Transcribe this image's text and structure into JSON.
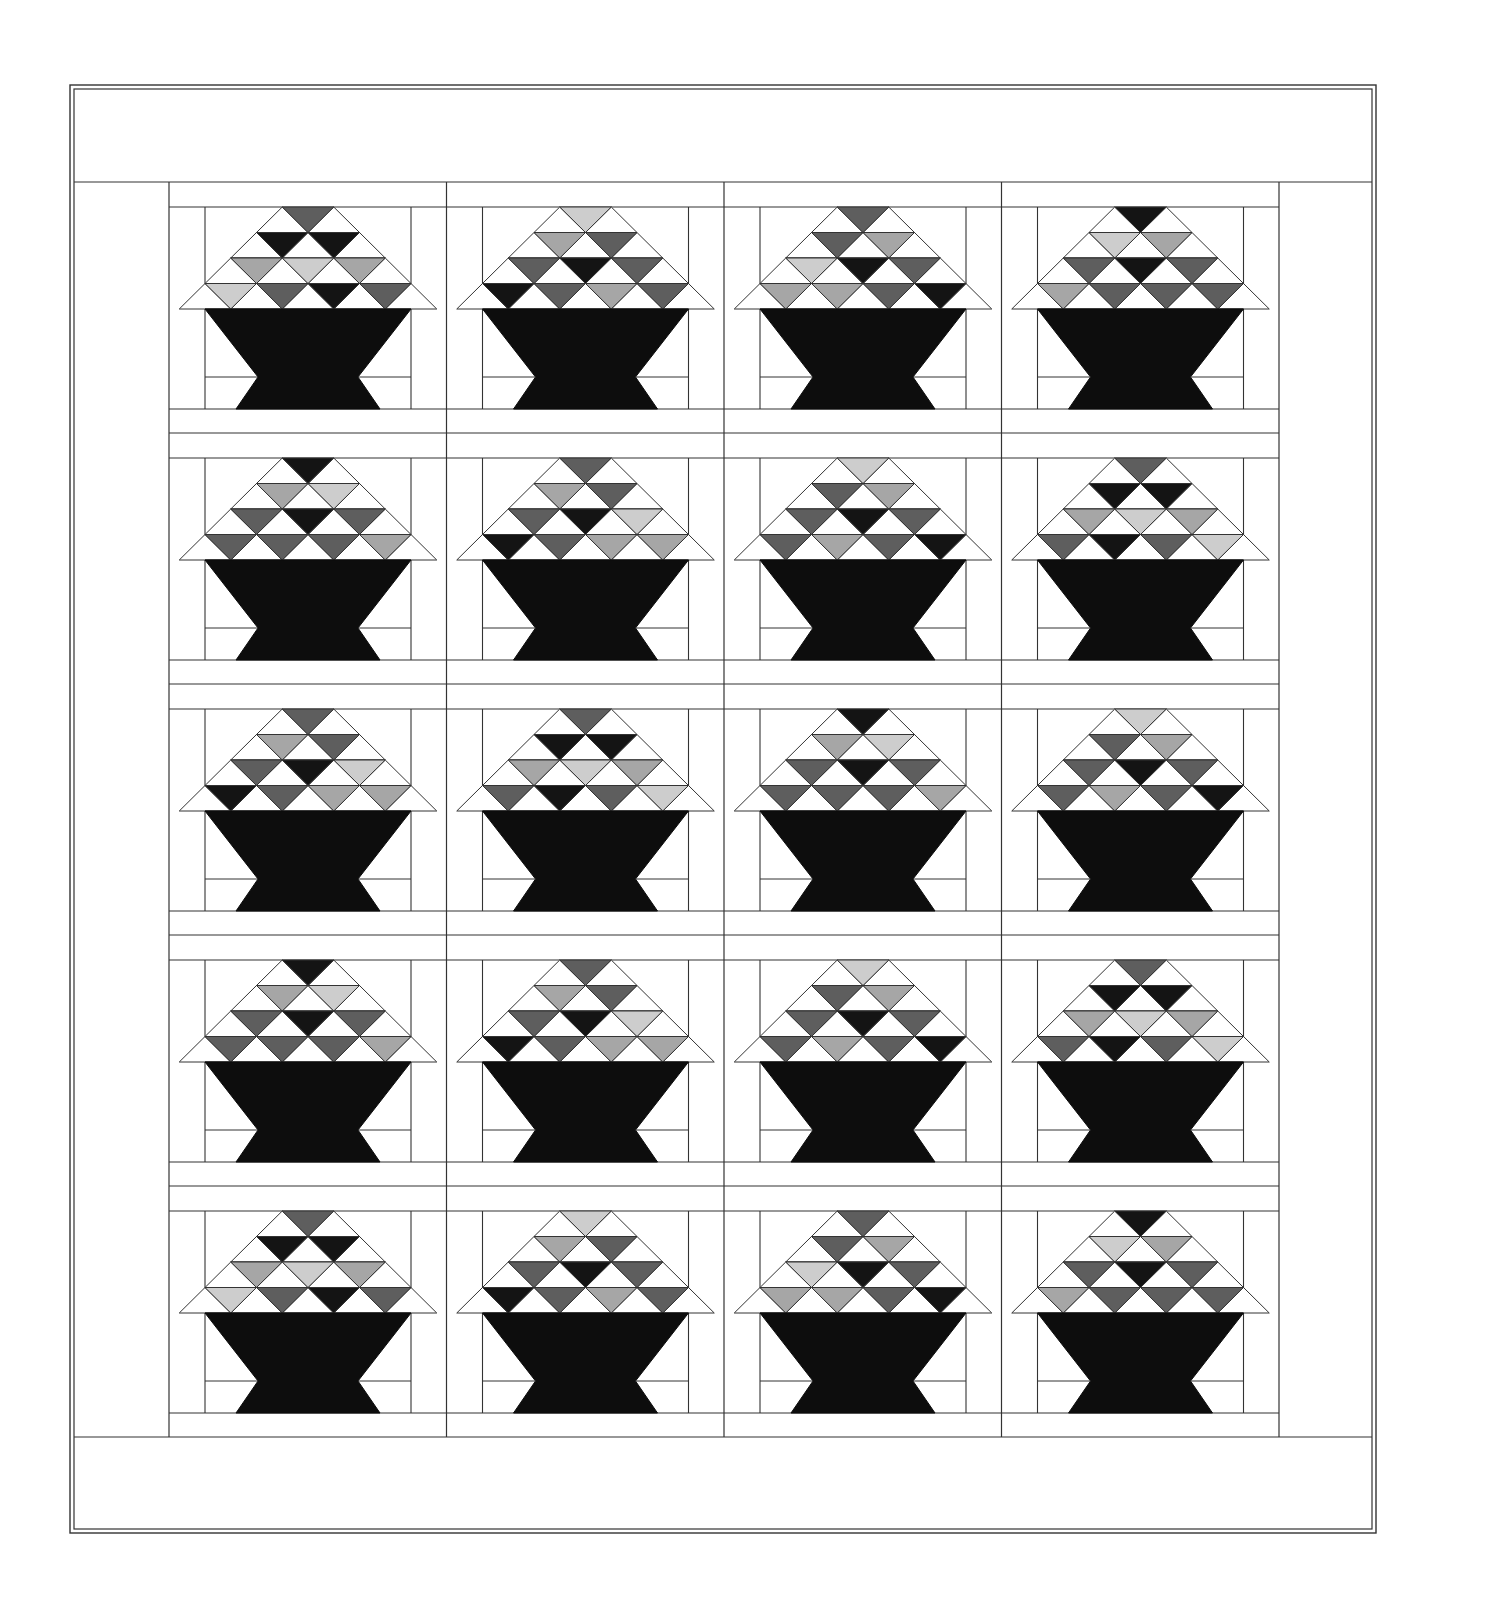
{
  "diagram": {
    "type": "quilt-layout",
    "grid": {
      "columns": 4,
      "rows": 5
    },
    "colors": {
      "background": "#ffffff",
      "line": "#333333",
      "basket": "#0d0d0d",
      "K": "#141414",
      "D": "#5e5e5e",
      "M": "#a6a6a6",
      "L": "#cdcdcd"
    },
    "color_legend": {
      "K": "black",
      "D": "dark gray",
      "M": "medium gray",
      "L": "light gray"
    },
    "outer_border": {
      "x": 70,
      "y": 85,
      "w": 1306,
      "h": 1448,
      "double_line": true
    },
    "center": {
      "x": 169,
      "y": 182,
      "col_width": 277.5,
      "row_height": 251
    },
    "blocks": [
      {
        "row": 1,
        "col": 1,
        "triangles": [
          [
            "D"
          ],
          [
            "K",
            "K"
          ],
          [
            "M",
            "L",
            "M"
          ],
          [
            "L",
            "D",
            "K",
            "D"
          ]
        ]
      },
      {
        "row": 1,
        "col": 2,
        "triangles": [
          [
            "L"
          ],
          [
            "M",
            "D"
          ],
          [
            "D",
            "K",
            "D"
          ],
          [
            "K",
            "D",
            "M",
            "D"
          ]
        ]
      },
      {
        "row": 1,
        "col": 3,
        "triangles": [
          [
            "D"
          ],
          [
            "D",
            "M"
          ],
          [
            "L",
            "K",
            "D"
          ],
          [
            "M",
            "M",
            "D",
            "K"
          ]
        ]
      },
      {
        "row": 1,
        "col": 4,
        "triangles": [
          [
            "K"
          ],
          [
            "L",
            "M"
          ],
          [
            "D",
            "K",
            "D"
          ],
          [
            "M",
            "D",
            "D",
            "D"
          ]
        ]
      },
      {
        "row": 2,
        "col": 1,
        "triangles": [
          [
            "K"
          ],
          [
            "M",
            "L"
          ],
          [
            "D",
            "K",
            "D"
          ],
          [
            "D",
            "D",
            "D",
            "M"
          ]
        ]
      },
      {
        "row": 2,
        "col": 2,
        "triangles": [
          [
            "D"
          ],
          [
            "M",
            "D"
          ],
          [
            "D",
            "K",
            "L"
          ],
          [
            "K",
            "D",
            "M",
            "M"
          ]
        ]
      },
      {
        "row": 2,
        "col": 3,
        "triangles": [
          [
            "L"
          ],
          [
            "D",
            "M"
          ],
          [
            "D",
            "K",
            "D"
          ],
          [
            "D",
            "M",
            "D",
            "K"
          ]
        ]
      },
      {
        "row": 2,
        "col": 4,
        "triangles": [
          [
            "D"
          ],
          [
            "K",
            "K"
          ],
          [
            "M",
            "L",
            "M"
          ],
          [
            "D",
            "K",
            "D",
            "L"
          ]
        ]
      },
      {
        "row": 3,
        "col": 1,
        "triangles": [
          [
            "D"
          ],
          [
            "M",
            "D"
          ],
          [
            "D",
            "K",
            "L"
          ],
          [
            "K",
            "D",
            "M",
            "M"
          ]
        ]
      },
      {
        "row": 3,
        "col": 2,
        "triangles": [
          [
            "D"
          ],
          [
            "K",
            "K"
          ],
          [
            "M",
            "L",
            "M"
          ],
          [
            "D",
            "K",
            "D",
            "L"
          ]
        ]
      },
      {
        "row": 3,
        "col": 3,
        "triangles": [
          [
            "K"
          ],
          [
            "M",
            "L"
          ],
          [
            "D",
            "K",
            "D"
          ],
          [
            "D",
            "D",
            "D",
            "M"
          ]
        ]
      },
      {
        "row": 3,
        "col": 4,
        "triangles": [
          [
            "L"
          ],
          [
            "D",
            "M"
          ],
          [
            "D",
            "K",
            "D"
          ],
          [
            "D",
            "M",
            "D",
            "K"
          ]
        ]
      },
      {
        "row": 4,
        "col": 1,
        "triangles": [
          [
            "K"
          ],
          [
            "M",
            "L"
          ],
          [
            "D",
            "K",
            "D"
          ],
          [
            "D",
            "D",
            "D",
            "M"
          ]
        ]
      },
      {
        "row": 4,
        "col": 2,
        "triangles": [
          [
            "D"
          ],
          [
            "M",
            "D"
          ],
          [
            "D",
            "K",
            "L"
          ],
          [
            "K",
            "D",
            "M",
            "M"
          ]
        ]
      },
      {
        "row": 4,
        "col": 3,
        "triangles": [
          [
            "L"
          ],
          [
            "D",
            "M"
          ],
          [
            "D",
            "K",
            "D"
          ],
          [
            "D",
            "M",
            "D",
            "K"
          ]
        ]
      },
      {
        "row": 4,
        "col": 4,
        "triangles": [
          [
            "D"
          ],
          [
            "K",
            "K"
          ],
          [
            "M",
            "L",
            "M"
          ],
          [
            "D",
            "K",
            "D",
            "L"
          ]
        ]
      },
      {
        "row": 5,
        "col": 1,
        "triangles": [
          [
            "D"
          ],
          [
            "K",
            "K"
          ],
          [
            "M",
            "L",
            "M"
          ],
          [
            "L",
            "D",
            "K",
            "D"
          ]
        ]
      },
      {
        "row": 5,
        "col": 2,
        "triangles": [
          [
            "L"
          ],
          [
            "M",
            "D"
          ],
          [
            "D",
            "K",
            "D"
          ],
          [
            "K",
            "D",
            "M",
            "D"
          ]
        ]
      },
      {
        "row": 5,
        "col": 3,
        "triangles": [
          [
            "D"
          ],
          [
            "D",
            "M"
          ],
          [
            "L",
            "K",
            "D"
          ],
          [
            "M",
            "M",
            "D",
            "K"
          ]
        ]
      },
      {
        "row": 5,
        "col": 4,
        "triangles": [
          [
            "K"
          ],
          [
            "L",
            "M"
          ],
          [
            "D",
            "K",
            "D"
          ],
          [
            "M",
            "D",
            "D",
            "D"
          ]
        ]
      }
    ]
  }
}
